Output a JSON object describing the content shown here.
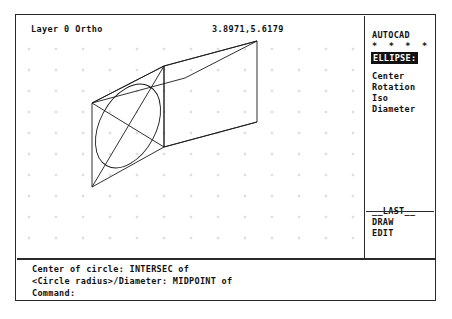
{
  "status": {
    "layer": "Layer 0 Ortho",
    "coordinates": "3.8971,5.6179"
  },
  "side_menu": {
    "title": "AUTOCAD",
    "stars": "* * * *",
    "current_command": "ELLIPSE:",
    "options": [
      "Center",
      "Rotation",
      "Iso",
      "Diameter"
    ],
    "footer": [
      "__LAST__",
      "DRAW",
      "EDIT"
    ]
  },
  "command_area": {
    "lines": [
      "Center of circle: INTERSEC of",
      "<Circle radius>/Diameter: MIDPOINT of",
      "Command:"
    ]
  },
  "drawing": {
    "description": "Isometric wireframe box with an inscribed ellipse on the left face",
    "stroke_color": "#1a1a1a",
    "grid_color": "#c9c9c9",
    "grid_spacing_x": 27,
    "grid_spacing_y": 21,
    "grid_origin_x": 12,
    "grid_origin_y": 12,
    "box": {
      "front_face": [
        {
          "x": 75,
          "y": 66
        },
        {
          "x": 147,
          "y": 29
        },
        {
          "x": 147,
          "y": 110
        },
        {
          "x": 75,
          "y": 150
        }
      ],
      "back_offset": {
        "x": 93,
        "y": -25
      },
      "note": "front-left parallelogram face, extruded right-and-up to form the solid"
    },
    "ellipse": {
      "center": {
        "x": 111,
        "y": 89
      },
      "radius_major": 45,
      "radius_minor": 28,
      "rotation_deg": -62,
      "note": "inscribed in front face, tangent at the four edge midpoints"
    },
    "diagonals": "both diagonals of the front face are drawn as construction lines"
  }
}
